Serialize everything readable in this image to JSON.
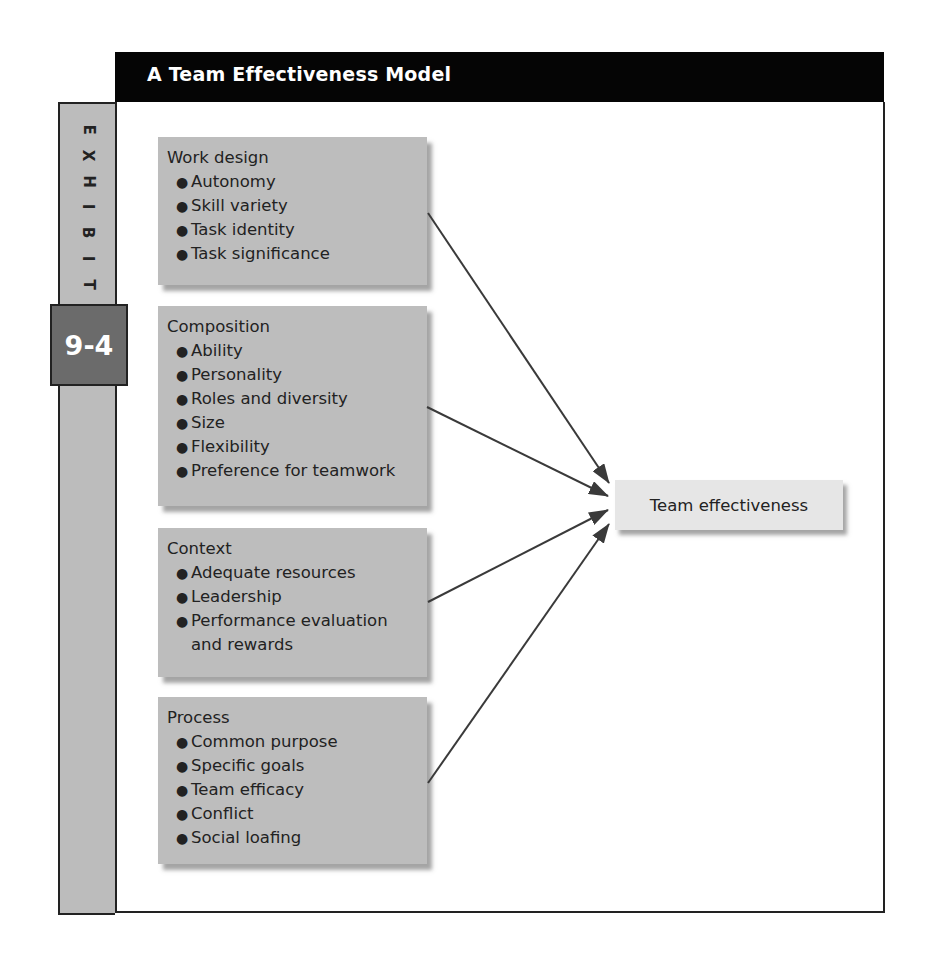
{
  "header": {
    "title": "A Team Effectiveness Model"
  },
  "exhibit": {
    "letters": [
      "E",
      "X",
      "H",
      "I",
      "B",
      "I",
      "T"
    ],
    "number": "9-4"
  },
  "factors": [
    {
      "title": "Work design",
      "items": [
        "Autonomy",
        "Skill variety",
        "Task identity",
        "Task significance"
      ]
    },
    {
      "title": "Composition",
      "items": [
        "Ability",
        "Personality",
        "Roles and diversity",
        "Size",
        "Flexibility",
        "Preference for teamwork"
      ]
    },
    {
      "title": "Context",
      "items": [
        "Adequate resources",
        "Leadership",
        "Performance evaluation and rewards"
      ]
    },
    {
      "title": "Process",
      "items": [
        "Common purpose",
        "Specific goals",
        "Team efficacy",
        "Conflict",
        "Social loafing"
      ]
    }
  ],
  "outcome": {
    "label": "Team effectiveness"
  },
  "edges": [
    {
      "from": "Work design",
      "to": "Team effectiveness"
    },
    {
      "from": "Composition",
      "to": "Team effectiveness"
    },
    {
      "from": "Context",
      "to": "Team effectiveness"
    },
    {
      "from": "Process",
      "to": "Team effectiveness"
    }
  ],
  "colors": {
    "header_bg": "#050505",
    "factor_bg": "#bdbdbd",
    "outcome_bg": "#e6e6e6",
    "badge_bg": "#6b6b6b",
    "arrow": "#3a3a3a"
  }
}
